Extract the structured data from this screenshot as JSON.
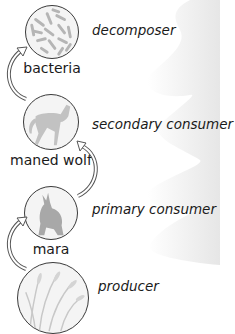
{
  "diagram": {
    "type": "food-chain",
    "levels": [
      {
        "organism": "bacteria",
        "role": "decomposer",
        "icon": "bacteria-icon"
      },
      {
        "organism": "maned wolf",
        "role": "secondary consumer",
        "icon": "maned-wolf-icon"
      },
      {
        "organism": "mara",
        "role": "primary consumer",
        "icon": "mara-icon"
      },
      {
        "organism": "",
        "role": "producer",
        "icon": "grass-icon"
      }
    ],
    "arrows": [
      {
        "from": "producer",
        "to": "mara"
      },
      {
        "from": "mara",
        "to": "maned wolf"
      },
      {
        "from": "maned wolf",
        "to": "bacteria"
      }
    ],
    "colors": {
      "background": "#ffffff",
      "wave": "#ececec",
      "outline": "#3a3a3a",
      "illustration": "#b8b8b8"
    }
  }
}
